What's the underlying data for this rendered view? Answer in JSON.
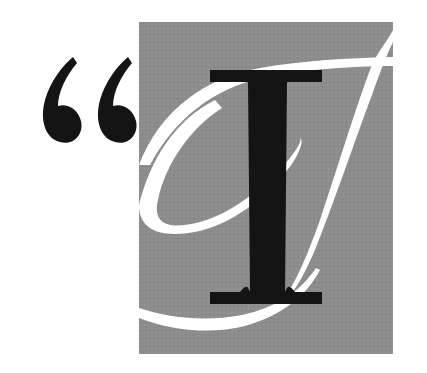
{
  "drop_cap": {
    "letter": "I",
    "opening_quote": "“",
    "description": "Decorative drop cap: opening quotation marks beside a gray square containing a white script I flourish and a black serif I"
  },
  "colors": {
    "background": "#ffffff",
    "panel": "#8c8c8c",
    "flourish": "#ffffff",
    "letter": "#141414",
    "quote": "#141414"
  }
}
